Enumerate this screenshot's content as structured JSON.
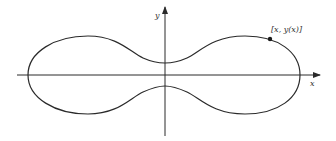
{
  "diagram": {
    "type": "parametric-curve",
    "axes": {
      "x_label": "x",
      "y_label": "y"
    },
    "point_label": "[x, y(x)]",
    "colors": {
      "stroke": "#2a2a2a",
      "background": "#ffffff"
    }
  }
}
